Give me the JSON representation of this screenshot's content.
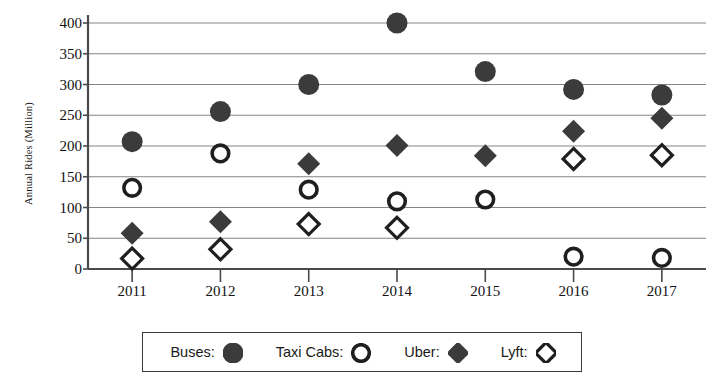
{
  "chart_data": {
    "type": "scatter",
    "title": "",
    "subtitle": "",
    "xlabel": "",
    "ylabel": "Annual Rides (Million)",
    "categories": [
      "2011",
      "2012",
      "2013",
      "2014",
      "2015",
      "2016",
      "2017"
    ],
    "x": [
      2011,
      2012,
      2013,
      2014,
      2015,
      2016,
      2017
    ],
    "xlim": [
      2010.5,
      2017.5
    ],
    "ylim": [
      0,
      400
    ],
    "y_ticks": [
      0,
      50,
      100,
      150,
      200,
      250,
      300,
      350,
      400
    ],
    "y_tick_labels": [
      "0",
      "50",
      "100",
      "150",
      "200",
      "250",
      "300",
      "350",
      "400"
    ],
    "grid": "horizontal",
    "legend_position": "bottom",
    "series": [
      {
        "name": "Buses",
        "marker": "filled-circle",
        "color": "#3b3b3b",
        "values": [
          207,
          256,
          300,
          400,
          321,
          292,
          283
        ]
      },
      {
        "name": "Taxi Cabs",
        "marker": "open-circle",
        "color": "#1f1f1f",
        "values": [
          132,
          188,
          129,
          110,
          113,
          20,
          18
        ]
      },
      {
        "name": "Uber",
        "marker": "filled-diamond",
        "color": "#3b3b3b",
        "values": [
          58,
          77,
          171,
          201,
          184,
          224,
          245
        ]
      },
      {
        "name": "Lyft",
        "marker": "open-diamond",
        "color": "#1f1f1f",
        "values": [
          17,
          32,
          73,
          67,
          null,
          179,
          185
        ]
      }
    ]
  },
  "legend": {
    "entries": [
      {
        "label": "Buses:",
        "marker": "filled-circle"
      },
      {
        "label": "Taxi Cabs:",
        "marker": "open-circle"
      },
      {
        "label": "Uber:",
        "marker": "filled-diamond"
      },
      {
        "label": "Lyft:",
        "marker": "open-diamond"
      }
    ]
  },
  "axes": {
    "y_title": "Annual Rides (Million)",
    "axis_color": "#4a4a4a",
    "grid_color": "#858585"
  }
}
